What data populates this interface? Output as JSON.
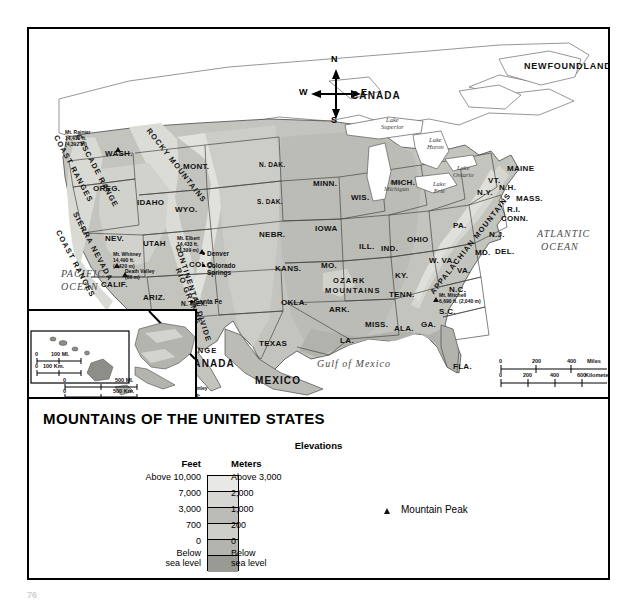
{
  "title": "MOUNTAINS OF THE UNITED STATES",
  "page_number": "76",
  "compass": {
    "north": "N",
    "south": "S",
    "east": "E",
    "west": "W"
  },
  "countries": [
    {
      "name": "CANADA",
      "x": 322,
      "y": 62
    },
    {
      "name": "MEXICO",
      "x": 226,
      "y": 347
    },
    {
      "name": "CANADA",
      "x": 156,
      "y": 330
    }
  ],
  "regions": [
    {
      "name": "NEWFOUNDLAND",
      "x": 495,
      "y": 33
    }
  ],
  "oceans": [
    {
      "name": "PACIFIC",
      "x": 32,
      "y": 240
    },
    {
      "name": "OCEAN",
      "x": 32,
      "y": 253
    },
    {
      "name": "ATLANTIC",
      "x": 508,
      "y": 200
    },
    {
      "name": "OCEAN",
      "x": 512,
      "y": 213
    },
    {
      "name": "Gulf of Mexico",
      "x": 288,
      "y": 330
    }
  ],
  "lakes": [
    {
      "name": "Lake\nSuperior",
      "x": 352,
      "y": 88
    },
    {
      "name": "Lake\nHuron",
      "x": 398,
      "y": 108
    },
    {
      "name": "Lake\nOntario",
      "x": 424,
      "y": 136
    },
    {
      "name": "Lake\nErie",
      "x": 404,
      "y": 152
    },
    {
      "name": "Lake\nMichigan",
      "x": 355,
      "y": 150
    }
  ],
  "mountain_ranges": [
    {
      "name": "COAST RANGES",
      "x": 30,
      "y": 105,
      "rotate": 62
    },
    {
      "name": "CASCADE RANGE",
      "x": 52,
      "y": 104,
      "rotate": 62
    },
    {
      "name": "SIERRA NEVADA",
      "x": 49,
      "y": 182,
      "rotate": 62
    },
    {
      "name": "COAST RANGES",
      "x": 32,
      "y": 200,
      "rotate": 62
    },
    {
      "name": "ROCKY MOUNTAINS",
      "x": 122,
      "y": 98,
      "rotate": 52
    },
    {
      "name": "RIO GRANDE",
      "x": 152,
      "y": 238,
      "rotate": 68
    },
    {
      "name": "CONTINENTAL DIVIDE",
      "x": 152,
      "y": 215,
      "rotate": 72
    },
    {
      "name": "OZARK",
      "x": 304,
      "y": 248,
      "rotate": 0
    },
    {
      "name": "MOUNTAINS",
      "x": 296,
      "y": 258,
      "rotate": 0
    },
    {
      "name": "APPALACHIAN MOUNTAINS",
      "x": 400,
      "y": 262,
      "rotate": -52
    },
    {
      "name": "BROOKS RANGE",
      "x": 112,
      "y": 318,
      "rotate": 0
    },
    {
      "name": "ALASKA RANGE",
      "x": 104,
      "y": 338,
      "rotate": 22
    }
  ],
  "states": [
    {
      "n": "WASH.",
      "x": 76,
      "y": 121
    },
    {
      "n": "OREG.",
      "x": 64,
      "y": 156
    },
    {
      "n": "IDAHO",
      "x": 108,
      "y": 170
    },
    {
      "n": "MONT.",
      "x": 154,
      "y": 134
    },
    {
      "n": "WYO.",
      "x": 146,
      "y": 177
    },
    {
      "n": "NEV.",
      "x": 76,
      "y": 206
    },
    {
      "n": "UTAH",
      "x": 114,
      "y": 211
    },
    {
      "n": "COLO.",
      "x": 160,
      "y": 232
    },
    {
      "n": "CALIF.",
      "x": 72,
      "y": 252
    },
    {
      "n": "ARIZ.",
      "x": 114,
      "y": 265
    },
    {
      "n": "N. MEX.",
      "x": 152,
      "y": 272
    },
    {
      "n": "N. DAK.",
      "x": 230,
      "y": 133
    },
    {
      "n": "S. DAK.",
      "x": 228,
      "y": 170
    },
    {
      "n": "NEBR.",
      "x": 230,
      "y": 202
    },
    {
      "n": "KANS.",
      "x": 246,
      "y": 236
    },
    {
      "n": "OKLA.",
      "x": 252,
      "y": 270
    },
    {
      "n": "TEXAS",
      "x": 230,
      "y": 311
    },
    {
      "n": "MINN.",
      "x": 284,
      "y": 151
    },
    {
      "n": "IOWA",
      "x": 286,
      "y": 196
    },
    {
      "n": "MO.",
      "x": 292,
      "y": 233
    },
    {
      "n": "ARK.",
      "x": 300,
      "y": 277
    },
    {
      "n": "LA.",
      "x": 311,
      "y": 308
    },
    {
      "n": "WIS.",
      "x": 322,
      "y": 165
    },
    {
      "n": "ILL.",
      "x": 330,
      "y": 214
    },
    {
      "n": "MICH.",
      "x": 362,
      "y": 150
    },
    {
      "n": "IND.",
      "x": 352,
      "y": 216
    },
    {
      "n": "OHIO",
      "x": 378,
      "y": 207
    },
    {
      "n": "KY.",
      "x": 366,
      "y": 243
    },
    {
      "n": "TENN.",
      "x": 360,
      "y": 262
    },
    {
      "n": "MISS.",
      "x": 336,
      "y": 292
    },
    {
      "n": "ALA.",
      "x": 365,
      "y": 296
    },
    {
      "n": "GA.",
      "x": 392,
      "y": 292
    },
    {
      "n": "FLA.",
      "x": 424,
      "y": 334
    },
    {
      "n": "S.C.",
      "x": 410,
      "y": 279
    },
    {
      "n": "N.C.",
      "x": 420,
      "y": 257
    },
    {
      "n": "VA.",
      "x": 428,
      "y": 238
    },
    {
      "n": "W. VA.",
      "x": 400,
      "y": 228
    },
    {
      "n": "PA.",
      "x": 424,
      "y": 193
    },
    {
      "n": "MD.",
      "x": 446,
      "y": 220
    },
    {
      "n": "DEL.",
      "x": 466,
      "y": 219
    },
    {
      "n": "N.J.",
      "x": 460,
      "y": 202
    },
    {
      "n": "N.Y.",
      "x": 448,
      "y": 160
    },
    {
      "n": "CONN.",
      "x": 472,
      "y": 186
    },
    {
      "n": "R.I.",
      "x": 478,
      "y": 177
    },
    {
      "n": "MASS.",
      "x": 487,
      "y": 166
    },
    {
      "n": "VT.",
      "x": 459,
      "y": 148
    },
    {
      "n": "N.H.",
      "x": 470,
      "y": 155
    },
    {
      "n": "MAINE",
      "x": 478,
      "y": 136
    },
    {
      "n": "HAWAII",
      "x": 28,
      "y": 335
    },
    {
      "n": "ALASKA",
      "x": 120,
      "y": 330
    }
  ],
  "cities": [
    {
      "n": "Denver",
      "x": 178,
      "y": 222
    },
    {
      "n": "Colorado\nSprings",
      "x": 178,
      "y": 234
    },
    {
      "n": "Santa Fe",
      "x": 166,
      "y": 270
    }
  ],
  "peaks": [
    {
      "name": "Mt. Rainier",
      "feet": "14,410 ft.",
      "meters": "(4,392 m)",
      "label_x": 36,
      "label_y": 101,
      "marker_x": 86,
      "marker_y": 118
    },
    {
      "name": "Mt. Whitney",
      "feet": "14,490 ft.",
      "meters": "(4,420 m)",
      "label_x": 84,
      "label_y": 223,
      "marker_x": 85,
      "marker_y": 234
    },
    {
      "name": "Death Valley",
      "feet": "",
      "meters": "(86 m)",
      "label_x": 96,
      "label_y": 240,
      "marker_x": 93,
      "marker_y": 243
    },
    {
      "name": "Mt. Elbert",
      "feet": "14,433 ft.",
      "meters": "(4,399 m)",
      "label_x": 148,
      "label_y": 207,
      "marker_x": 170,
      "marker_y": 220
    },
    {
      "name": "Mt. Mitchell",
      "feet": "6,690 ft. (2,040 m)",
      "meters": "",
      "label_x": 410,
      "label_y": 264,
      "marker_x": 404,
      "marker_y": 268
    },
    {
      "name": "Mauna Kea",
      "feet": "13,800 ft.",
      "meters": "(4,210 m)",
      "label_x": 76,
      "label_y": 318,
      "marker_x": 82,
      "marker_y": 345
    },
    {
      "name": "Mt. McKinley",
      "feet": "20,320 ft.",
      "meters": "(6,190 m)",
      "label_x": 148,
      "label_y": 357,
      "marker_x": 140,
      "marker_y": 348
    }
  ],
  "scales": [
    {
      "id": "main-scale",
      "miles_label": "Miles",
      "km_label": "Kilometers",
      "miles_ticks": [
        "0",
        "200",
        "400"
      ],
      "km_ticks": [
        "0",
        "200",
        "400",
        "600"
      ]
    },
    {
      "id": "hawaii-scale",
      "miles_label": "100 MI.",
      "km_label": "100 Km.",
      "miles_ticks": [
        "0",
        "100 MI."
      ],
      "km_ticks": [
        "0",
        "100 Km."
      ]
    },
    {
      "id": "alaska-scale",
      "miles_label": "500 MI.",
      "km_label": "500 Km.",
      "miles_ticks": [
        "0",
        "500 MI."
      ],
      "km_ticks": [
        "0",
        "500 Km."
      ]
    }
  ],
  "legend": {
    "heading": "Elevations",
    "feet_header": "Feet",
    "meters_header": "Meters",
    "peak_symbol_label": "Mountain Peak",
    "rows": [
      {
        "feet": "Above 10,000",
        "meters": "Above 3,000",
        "color": "#e8e8e6"
      },
      {
        "feet": "7,000",
        "meters": "2,000",
        "color": "#d6d6d2"
      },
      {
        "feet": "3,000",
        "meters": "1,000",
        "color": "#bcbcb6"
      },
      {
        "feet": "700",
        "meters": "200",
        "color": "#cfcfc9"
      },
      {
        "feet": "0",
        "meters": "0",
        "color": "#b4b4ae"
      },
      {
        "feet": "Below\nsea level",
        "meters": "Below\nsea level",
        "color": "#9a9a94"
      }
    ]
  },
  "colors": {
    "land_low": "#c9c9c3",
    "land_mid": "#bdbdb7",
    "land_high": "#d8d8d3",
    "water": "#ffffff",
    "outline": "#4a4a4a",
    "text": "#111111"
  }
}
